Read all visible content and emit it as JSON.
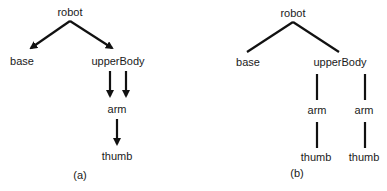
{
  "diagram": {
    "panel_a": {
      "caption": "(a)",
      "nodes": {
        "robot": "robot",
        "base": "base",
        "upperBody": "upperBody",
        "arm": "arm",
        "thumb": "thumb"
      },
      "edges": [
        {
          "from": "robot",
          "to": "base",
          "type": "arrow"
        },
        {
          "from": "robot",
          "to": "upperBody",
          "type": "arrow"
        },
        {
          "from": "upperBody",
          "to": "arm",
          "type": "arrow"
        },
        {
          "from": "upperBody",
          "to": "arm",
          "type": "arrow"
        },
        {
          "from": "arm",
          "to": "thumb",
          "type": "arrow"
        }
      ]
    },
    "panel_b": {
      "caption": "(b)",
      "nodes": {
        "robot": "robot",
        "base": "base",
        "upperBody": "upperBody",
        "arm_1": "arm",
        "arm_2": "arm",
        "thumb_1": "thumb",
        "thumb_2": "thumb"
      },
      "edges": [
        {
          "from": "robot",
          "to": "base",
          "type": "line"
        },
        {
          "from": "robot",
          "to": "upperBody",
          "type": "line"
        },
        {
          "from": "upperBody",
          "to": "arm_1",
          "type": "line"
        },
        {
          "from": "upperBody",
          "to": "arm_2",
          "type": "line"
        },
        {
          "from": "arm_1",
          "to": "thumb_1",
          "type": "line"
        },
        {
          "from": "arm_2",
          "to": "thumb_2",
          "type": "line"
        }
      ]
    },
    "colors": {
      "stroke": "#111111",
      "text": "#1a1a1a",
      "background": "#ffffff"
    }
  }
}
